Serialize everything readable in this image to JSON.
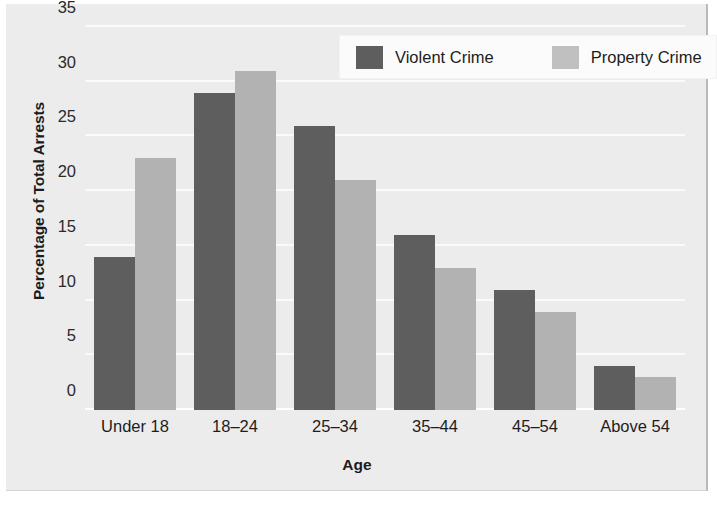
{
  "chart_data": {
    "type": "bar",
    "title": "",
    "xlabel": "Age",
    "ylabel": "Percentage of Total Arrests",
    "categories": [
      "Under 18",
      "18–24",
      "25–34",
      "35–44",
      "45–54",
      "Above 54"
    ],
    "series": [
      {
        "name": "Violent Crime",
        "color": "#5e5e5f",
        "values": [
          14,
          29,
          26,
          16,
          11,
          4
        ]
      },
      {
        "name": "Property Crime",
        "color": "#b2b2b3",
        "values": [
          23,
          31,
          21,
          13,
          9,
          3
        ]
      }
    ],
    "ylim": [
      0,
      35
    ],
    "yticks": [
      0,
      5,
      10,
      15,
      20,
      25,
      30,
      35
    ],
    "ytick_labels": [
      "0",
      "5",
      "10",
      "15",
      "20",
      "25",
      "30",
      "35"
    ],
    "grid": "horizontal-only",
    "legend_position": "top-right",
    "background_color": "#ececed",
    "gridline_color": "#fafafa"
  }
}
